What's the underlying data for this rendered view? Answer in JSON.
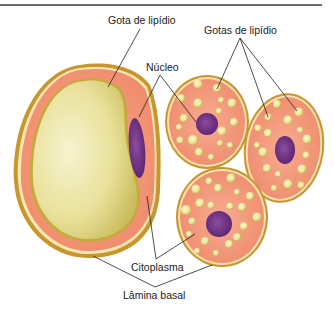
{
  "figure": {
    "labels": {
      "gota_lipidio": "Gota de lipídio",
      "gotas_lipidio": "Gotas de lipídio",
      "nucleo": "Núcleo",
      "citoplasma": "Citoplasma",
      "lamina_basal": "Lâmina basal"
    },
    "colors": {
      "outer_border": "#c8962e",
      "cytoplasm": "#f28e6f",
      "cytoplasm_light": "#f6a88c",
      "lipid": "#ede7a2",
      "lipid_shade": "#c9c063",
      "nucleus": "#6b2c7e",
      "nucleus_light": "#8a4a9c"
    },
    "cells": [
      {
        "type": "unilocular",
        "description": "Large cell with single lipid droplet and flattened peripheral nucleus"
      },
      {
        "type": "multilocular",
        "description": "Cell with multiple lipid droplets and central nucleus"
      },
      {
        "type": "multilocular",
        "description": "Cell with multiple lipid droplets and central nucleus"
      },
      {
        "type": "multilocular",
        "description": "Cell with multiple lipid droplets and central nucleus"
      }
    ]
  }
}
